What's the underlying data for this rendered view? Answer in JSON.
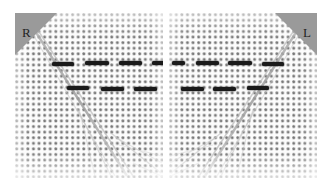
{
  "figure": {
    "background_color": "#ffffff",
    "width": 330,
    "height": 189
  },
  "panels": [
    {
      "id": "panel-right-breast",
      "side_label": "R",
      "side_name": "right",
      "marker_corner": "top-left",
      "marker_color": "#9a9a9a",
      "x": 15,
      "y": 13,
      "width": 148,
      "height": 165,
      "grid": {
        "dot_spacing_px": 5.6,
        "dot_color": "#3c3c3c",
        "background_color": "#fcfcfc"
      },
      "bands": [
        {
          "row": "upper",
          "x": 52,
          "y": 62,
          "width": 22,
          "height": 4
        },
        {
          "row": "upper",
          "x": 85,
          "y": 61,
          "width": 24,
          "height": 4
        },
        {
          "row": "upper",
          "x": 119,
          "y": 61,
          "width": 23,
          "height": 4
        },
        {
          "row": "upper",
          "x": 152,
          "y": 61,
          "width": 13,
          "height": 4
        },
        {
          "row": "lower",
          "x": 67,
          "y": 86,
          "width": 22,
          "height": 4
        },
        {
          "row": "lower",
          "x": 101,
          "y": 87,
          "width": 23,
          "height": 4
        },
        {
          "row": "lower",
          "x": 134,
          "y": 87,
          "width": 23,
          "height": 4
        }
      ]
    },
    {
      "id": "panel-left-breast",
      "side_label": "L",
      "side_name": "left",
      "marker_corner": "top-right",
      "marker_color": "#9a9a9a",
      "x": 169,
      "y": 13,
      "width": 148,
      "height": 165,
      "grid": {
        "dot_spacing_px": 5.6,
        "dot_spacing_note": "mirrored",
        "dot_color": "#3c3c3c",
        "background_color": "#fcfcfc"
      },
      "bands": [
        {
          "row": "upper",
          "x": 172,
          "y": 61,
          "width": 13,
          "height": 4
        },
        {
          "row": "upper",
          "x": 196,
          "y": 61,
          "width": 23,
          "height": 4
        },
        {
          "row": "upper",
          "x": 228,
          "y": 61,
          "width": 24,
          "height": 4
        },
        {
          "row": "upper",
          "x": 262,
          "y": 62,
          "width": 22,
          "height": 4
        },
        {
          "row": "lower",
          "x": 181,
          "y": 87,
          "width": 23,
          "height": 4
        },
        {
          "row": "lower",
          "x": 213,
          "y": 87,
          "width": 23,
          "height": 4
        },
        {
          "row": "lower",
          "x": 247,
          "y": 86,
          "width": 22,
          "height": 4
        }
      ]
    }
  ]
}
